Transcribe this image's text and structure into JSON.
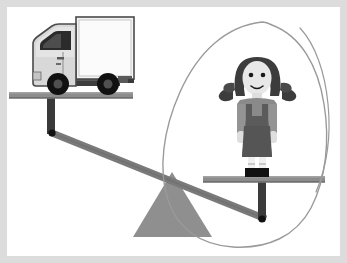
{
  "illustration": {
    "title": "Balance scale comparing a truck and a girl",
    "description": "A seesaw-style lever balance with a delivery truck on the raised left platform and a girl standing on the lowered right platform; the girl is circled by a hand-drawn oval.",
    "frame": {
      "border_color": "#dcdcdc",
      "background_color": "#ffffff",
      "width": 347,
      "height": 263
    },
    "colors": {
      "plank_gray": "#8c8c8c",
      "plank_dark_edge": "#6f6f6f",
      "beam_gray": "#7a7a7a",
      "post_dark": "#3a3a3a",
      "pivot_dot": "#111111",
      "fulcrum_gray": "#8f8f8f",
      "truck_body_light": "#d8d8d8",
      "truck_box_white": "#f4f4f4",
      "truck_outline": "#4a4a4a",
      "truck_window_dark": "#2b2b2b",
      "wheel_black": "#111111",
      "chassis_dark": "#3d3d3d",
      "hair_dark": "#3c3c3c",
      "skin_light": "#e8e8e8",
      "shirt_gray": "#8a8a8a",
      "pinafore_dark": "#5b5b5b",
      "sock_white": "#f0f0f0",
      "shoe_black": "#111111",
      "annotation_stroke": "#9a9a9a"
    },
    "elements": {
      "truck_label": "delivery-truck",
      "girl_label": "girl-figure",
      "left_platform_label": "left-platform-plank",
      "right_platform_label": "right-platform-plank",
      "beam_label": "lever-beam",
      "fulcrum_label": "triangular-fulcrum",
      "annotation_label": "hand-drawn-circle-around-girl"
    },
    "balance_state": {
      "left_side": "truck",
      "left_position": "raised",
      "right_side": "girl",
      "right_position": "lowered"
    }
  }
}
